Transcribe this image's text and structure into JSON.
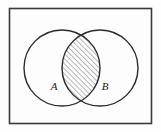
{
  "figure": {
    "name": "venn-diagram-intersection",
    "caption": "",
    "universe_box": {
      "label": "",
      "x": 9.5,
      "y": 8.5,
      "width": 142,
      "height": 115,
      "stroke": "#3a3a3a",
      "stroke_width": 1.6,
      "fill": "#fdfdfd"
    },
    "background_color": "#fefefe",
    "line_color": "#2b2b2b",
    "hatch_color": "#555555",
    "label_color": "#1a1a1a"
  },
  "sets": [
    {
      "id": "set-a",
      "label": "A",
      "cx": 62,
      "cy": 68,
      "r": 38,
      "label_x": 54,
      "label_y": 90
    },
    {
      "id": "set-b",
      "label": "B",
      "cx": 100,
      "cy": 68,
      "r": 38,
      "label_x": 105,
      "label_y": 90
    }
  ],
  "region": {
    "id": "intersection-region",
    "name": "A intersect B",
    "shaded": true,
    "hatch_angle_degrees": 45,
    "hatch_spacing_px": 3.6,
    "hatch_stroke_width": 0.8
  }
}
